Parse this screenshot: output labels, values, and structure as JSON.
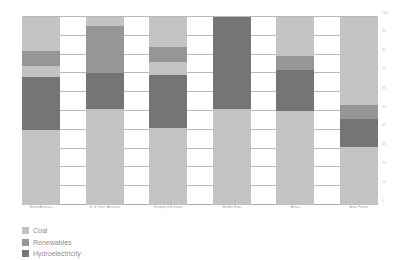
{
  "chart_data": {
    "type": "bar",
    "title": "",
    "subtitle": "",
    "xlabel": "",
    "ylabel": "",
    "stacked": true,
    "normalized_percent": true,
    "grid": true,
    "legend_position": "bottom-left",
    "ylim": [
      0,
      100
    ],
    "yticks": [
      0,
      10,
      20,
      30,
      40,
      50,
      60,
      70,
      80,
      90,
      100
    ],
    "ytick_labels": [
      "0",
      "10",
      "20",
      "30",
      "40",
      "50",
      "60",
      "70",
      "80",
      "90",
      "100"
    ],
    "categories": [
      "North America",
      "S. & Cent. America",
      "Europe & Eurasia",
      "Middle East",
      "Africa",
      "Asia Pacific"
    ],
    "series": [
      {
        "name": "Coal",
        "color": "#c3c3c3",
        "values": [
          40,
          51,
          41,
          51,
          50,
          31
        ]
      },
      {
        "name": "Hydroelectricity",
        "color": "#757575",
        "values": [
          28,
          19,
          28,
          49,
          22,
          15
        ]
      },
      {
        "name": "Renewables",
        "color": "#969696",
        "values": [
          8,
          25,
          8,
          0,
          7,
          7
        ]
      },
      {
        "name": "Coal-top",
        "color": "#c3c3c3",
        "values": [
          24,
          5,
          23,
          0,
          21,
          47
        ]
      }
    ],
    "stack_order_bottom_to_top": [
      "Coal",
      "Hydroelectricity",
      "Renewables",
      "Coal-top"
    ],
    "bars": [
      {
        "category": "North America",
        "segments": [
          {
            "series": "Coal",
            "color": "#c3c3c3",
            "from": 0,
            "to": 40,
            "size": 40
          },
          {
            "series": "Hydroelectricity",
            "color": "#757575",
            "from": 40,
            "to": 68,
            "size": 28
          },
          {
            "series": "Renewables-lower",
            "color": "#c3c3c3",
            "from": 68,
            "to": 74,
            "size": 6
          },
          {
            "series": "Renewables",
            "color": "#969696",
            "from": 74,
            "to": 82,
            "size": 8
          },
          {
            "series": "Coal-top",
            "color": "#c3c3c3",
            "from": 82,
            "to": 100,
            "size": 18
          }
        ]
      },
      {
        "category": "S. & Cent. America",
        "segments": [
          {
            "series": "Coal",
            "color": "#c3c3c3",
            "from": 0,
            "to": 51,
            "size": 51
          },
          {
            "series": "Hydroelectricity",
            "color": "#757575",
            "from": 51,
            "to": 70,
            "size": 19
          },
          {
            "series": "Renewables",
            "color": "#969696",
            "from": 70,
            "to": 95,
            "size": 25
          },
          {
            "series": "Coal-top",
            "color": "#c3c3c3",
            "from": 95,
            "to": 100,
            "size": 5
          }
        ]
      },
      {
        "category": "Europe & Eurasia",
        "segments": [
          {
            "series": "Coal",
            "color": "#c3c3c3",
            "from": 0,
            "to": 41,
            "size": 41
          },
          {
            "series": "Hydroelectricity",
            "color": "#757575",
            "from": 41,
            "to": 69,
            "size": 28
          },
          {
            "series": "Renewables-lower",
            "color": "#c3c3c3",
            "from": 69,
            "to": 76,
            "size": 7
          },
          {
            "series": "Renewables",
            "color": "#969696",
            "from": 76,
            "to": 84,
            "size": 8
          },
          {
            "series": "Coal-top",
            "color": "#c3c3c3",
            "from": 84,
            "to": 100,
            "size": 16
          }
        ]
      },
      {
        "category": "Middle East",
        "segments": [
          {
            "series": "Coal",
            "color": "#c3c3c3",
            "from": 0,
            "to": 51,
            "size": 51
          },
          {
            "series": "Hydroelectricity",
            "color": "#757575",
            "from": 51,
            "to": 100,
            "size": 49
          }
        ]
      },
      {
        "category": "Africa",
        "segments": [
          {
            "series": "Coal",
            "color": "#c3c3c3",
            "from": 0,
            "to": 50,
            "size": 50
          },
          {
            "series": "Hydroelectricity",
            "color": "#757575",
            "from": 50,
            "to": 72,
            "size": 22
          },
          {
            "series": "Renewables",
            "color": "#969696",
            "from": 72,
            "to": 79,
            "size": 7
          },
          {
            "series": "Coal-top",
            "color": "#c3c3c3",
            "from": 79,
            "to": 100,
            "size": 21
          }
        ]
      },
      {
        "category": "Asia Pacific",
        "segments": [
          {
            "series": "Coal",
            "color": "#c3c3c3",
            "from": 0,
            "to": 31,
            "size": 31
          },
          {
            "series": "Hydroelectricity",
            "color": "#757575",
            "from": 31,
            "to": 46,
            "size": 15
          },
          {
            "series": "Renewables",
            "color": "#969696",
            "from": 46,
            "to": 53,
            "size": 7
          },
          {
            "series": "Coal-top",
            "color": "#c3c3c3",
            "from": 53,
            "to": 100,
            "size": 47
          }
        ]
      }
    ],
    "legend": [
      {
        "label": "Coal",
        "color": "#c3c3c3"
      },
      {
        "label": "Renewables",
        "color": "#969696"
      },
      {
        "label": "Hydroelectricity",
        "color": "#757575"
      }
    ]
  },
  "colors": {
    "coal": "#c3c3c3",
    "renewables": "#969696",
    "hydroelectricity": "#757575",
    "gridline": "#b9b9b9",
    "axis": "#a9a9a9",
    "text": "#8f8f8f",
    "tick_text": "#bdbdbd",
    "background": "#ffffff"
  }
}
